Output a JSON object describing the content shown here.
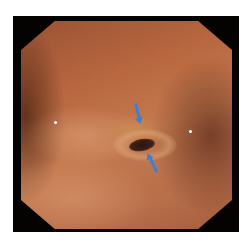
{
  "image": {
    "type": "endoscopic-photo",
    "frame_color": "#050302",
    "background_color": "#ffffff",
    "mucosa_color": "#b8673f",
    "annotations": [
      {
        "kind": "arrow",
        "direction": "down",
        "color": "#3b7fd6",
        "points_to": "lesion-upper-edge"
      },
      {
        "kind": "arrow",
        "direction": "up",
        "color": "#3b7fd6",
        "points_to": "lesion-lower-edge"
      }
    ]
  }
}
